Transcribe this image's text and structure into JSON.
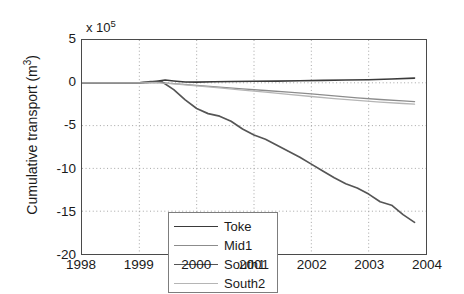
{
  "chart_data": {
    "type": "line",
    "title": "",
    "xlabel": "",
    "ylabel": "Cumulative transport (m",
    "ylabel_sup": "3",
    "ylabel_suffix": ")",
    "y_multiplier_prefix": "x 10",
    "y_multiplier_exp": "5",
    "xlim": [
      1998,
      2004
    ],
    "ylim": [
      -20,
      5
    ],
    "grid": true,
    "grid_style": "dotted",
    "legend_position": "lower left inside",
    "xticks": [
      "1998",
      "1999",
      "2000",
      "2001",
      "2002",
      "2003",
      "2004"
    ],
    "xtick_values": [
      1998,
      1999,
      2000,
      2001,
      2002,
      2003,
      2004
    ],
    "yticks": [
      "5",
      "0",
      "-5",
      "-10",
      "-15",
      "-20"
    ],
    "ytick_values": [
      5,
      0,
      -5,
      -10,
      -15,
      -20
    ],
    "series": [
      {
        "name": "Toke",
        "color": "#3a3a3a",
        "width": 1.6,
        "x": [
          1998.0,
          1998.5,
          1999.0,
          1999.15,
          1999.3,
          1999.45,
          1999.6,
          1999.8,
          2000.0,
          2000.3,
          2000.6,
          2001.0,
          2001.4,
          2001.8,
          2002.2,
          2002.6,
          2003.0,
          2003.4,
          2003.8
        ],
        "values": [
          0.0,
          0.0,
          0.0,
          0.05,
          0.18,
          0.32,
          0.22,
          0.1,
          0.08,
          0.12,
          0.15,
          0.18,
          0.2,
          0.24,
          0.28,
          0.32,
          0.36,
          0.44,
          0.55
        ]
      },
      {
        "name": "Mid1",
        "color": "#8c8c8c",
        "width": 1.3,
        "x": [
          1998.0,
          1998.5,
          1999.0,
          1999.3,
          1999.6,
          2000.0,
          2000.4,
          2000.8,
          2001.2,
          2001.6,
          2002.0,
          2002.4,
          2002.8,
          2003.2,
          2003.6,
          2003.8
        ],
        "values": [
          0.0,
          0.0,
          0.0,
          0.05,
          -0.1,
          -0.3,
          -0.5,
          -0.7,
          -0.9,
          -1.1,
          -1.3,
          -1.52,
          -1.75,
          -1.95,
          -2.12,
          -2.2
        ]
      },
      {
        "name": "South1",
        "color": "#555555",
        "width": 1.7,
        "x": [
          1998.0,
          1998.5,
          1999.0,
          1999.2,
          1999.4,
          1999.6,
          1999.8,
          2000.0,
          2000.2,
          2000.4,
          2000.6,
          2000.8,
          2001.0,
          2001.2,
          2001.4,
          2001.6,
          2001.8,
          2002.0,
          2002.2,
          2002.4,
          2002.6,
          2002.8,
          2003.0,
          2003.2,
          2003.4,
          2003.6,
          2003.8
        ],
        "values": [
          0.0,
          0.0,
          0.0,
          0.15,
          0.1,
          -0.8,
          -2.0,
          -3.0,
          -3.6,
          -3.9,
          -4.5,
          -5.4,
          -6.1,
          -6.6,
          -7.3,
          -8.0,
          -8.7,
          -9.5,
          -10.3,
          -11.1,
          -11.8,
          -12.3,
          -13.0,
          -13.9,
          -14.3,
          -15.4,
          -16.3
        ]
      },
      {
        "name": "South2",
        "color": "#b5b5b5",
        "width": 1.3,
        "x": [
          1998.0,
          1998.5,
          1999.0,
          1999.3,
          1999.6,
          2000.0,
          2000.4,
          2000.8,
          2001.2,
          2001.6,
          2002.0,
          2002.4,
          2002.8,
          2003.2,
          2003.6,
          2003.8
        ],
        "values": [
          0.0,
          0.0,
          0.0,
          0.02,
          -0.12,
          -0.35,
          -0.6,
          -0.85,
          -1.1,
          -1.35,
          -1.6,
          -1.85,
          -2.05,
          -2.25,
          -2.42,
          -2.5
        ]
      }
    ]
  }
}
